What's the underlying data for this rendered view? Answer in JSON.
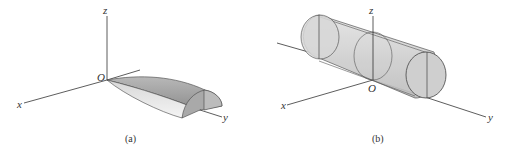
{
  "figures": [
    {
      "id": "a",
      "caption": "(a)",
      "axes": {
        "x": "x",
        "y": "y",
        "z": "z",
        "origin": "O"
      },
      "shape": "half-paraboloid solid along y-axis"
    },
    {
      "id": "b",
      "caption": "(b)",
      "axes": {
        "x": "x",
        "y": "y",
        "z": "z",
        "origin": "O"
      },
      "shape": "cylinder along y-axis with circular cross sections"
    }
  ],
  "colors": {
    "axis": "#333333",
    "solid_fill": "#c8c8c8",
    "solid_light": "#e6e6e6",
    "solid_dark": "#9a9a9a"
  }
}
